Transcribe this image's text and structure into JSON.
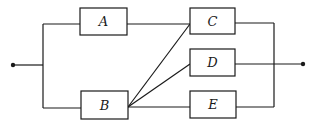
{
  "diagram": {
    "type": "reliability-block-diagram",
    "components": [
      {
        "id": "A",
        "label": "A"
      },
      {
        "id": "B",
        "label": "B"
      },
      {
        "id": "C",
        "label": "C"
      },
      {
        "id": "D",
        "label": "D"
      },
      {
        "id": "E",
        "label": "E"
      }
    ],
    "connections": [
      [
        "input",
        "A"
      ],
      [
        "input",
        "B"
      ],
      [
        "A",
        "C"
      ],
      [
        "B",
        "C"
      ],
      [
        "B",
        "D"
      ],
      [
        "B",
        "E"
      ],
      [
        "C",
        "output"
      ],
      [
        "D",
        "output"
      ],
      [
        "E",
        "output"
      ]
    ],
    "colors": {
      "stroke": "#1a1a1a",
      "background": "#ffffff"
    }
  }
}
